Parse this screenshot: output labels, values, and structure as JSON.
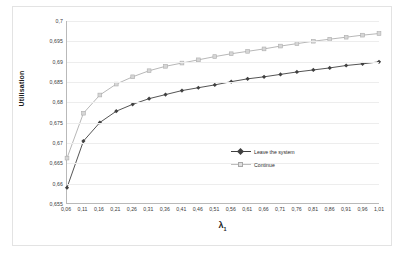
{
  "chart_data": {
    "type": "line",
    "title": "",
    "xlabel": "λ₁",
    "ylabel": "Utilisation",
    "grid": true,
    "legend_position": "inside-right",
    "xlim": [
      0.06,
      1.01
    ],
    "ylim": [
      0.655,
      0.7
    ],
    "xticklabels": [
      "0,06",
      "0,11",
      "0,16",
      "0,21",
      "0,26",
      "0,31",
      "0,36",
      "0,41",
      "0,46",
      "0,51",
      "0,56",
      "0,61",
      "0,66",
      "0,71",
      "0,76",
      "0,81",
      "0,86",
      "0,91",
      "0,96",
      "1,01"
    ],
    "yticklabels": [
      "0,7",
      "0,695",
      "0,69",
      "0,685",
      "0,68",
      "0,675",
      "0,67",
      "0,665",
      "0,66",
      "0,655"
    ],
    "ytickvalues": [
      0.7,
      0.695,
      0.69,
      0.685,
      0.68,
      0.675,
      0.67,
      0.665,
      0.66,
      0.655
    ],
    "x": [
      0.06,
      0.11,
      0.16,
      0.21,
      0.26,
      0.31,
      0.36,
      0.41,
      0.46,
      0.51,
      0.56,
      0.61,
      0.66,
      0.71,
      0.76,
      0.81,
      0.86,
      0.91,
      0.96,
      1.01
    ],
    "series": [
      {
        "name": "Leave the system",
        "color": "#404040",
        "marker": "diamond",
        "marker_fill": "#404040",
        "values": [
          0.6588,
          0.6703,
          0.6749,
          0.6777,
          0.6794,
          0.6808,
          0.6818,
          0.6828,
          0.6835,
          0.6842,
          0.685,
          0.6857,
          0.6862,
          0.6868,
          0.6874,
          0.6879,
          0.6884,
          0.689,
          0.6894,
          0.6899
        ]
      },
      {
        "name": "Continue",
        "color": "#aeaeae",
        "marker": "square",
        "marker_fill": "#d6d6d6",
        "values": [
          0.6661,
          0.6772,
          0.6817,
          0.6844,
          0.6862,
          0.6877,
          0.6888,
          0.6896,
          0.6904,
          0.6912,
          0.6919,
          0.6925,
          0.6931,
          0.6938,
          0.6944,
          0.695,
          0.6955,
          0.696,
          0.6965,
          0.6969
        ]
      }
    ]
  },
  "legend": {
    "items": [
      {
        "label": "Leave the system"
      },
      {
        "label": "Continue"
      }
    ]
  }
}
